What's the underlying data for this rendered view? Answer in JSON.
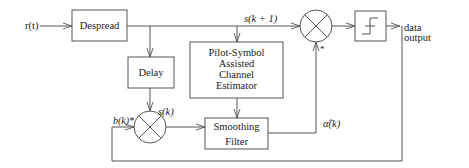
{
  "diagram": {
    "title": "",
    "input_label": "r(t)",
    "blocks": {
      "despread": "Despread",
      "delay": "Delay",
      "estimator": [
        "Pilot-Symbol",
        "Assisted",
        "Channel",
        "Estimator"
      ],
      "smoothing": [
        "Smoothing",
        "Filter"
      ],
      "decision": "decision-threshold"
    },
    "signals": {
      "s_next": "s(k + 1)",
      "s_k": "s(k)",
      "b_k_conj": "b(k)*",
      "alpha_hat": "α̂(k)",
      "conj_mark": "*"
    },
    "output_label": [
      "data",
      "output"
    ]
  },
  "colors": {
    "line": "#555555",
    "text": "#222222",
    "background": "#ffffff"
  }
}
